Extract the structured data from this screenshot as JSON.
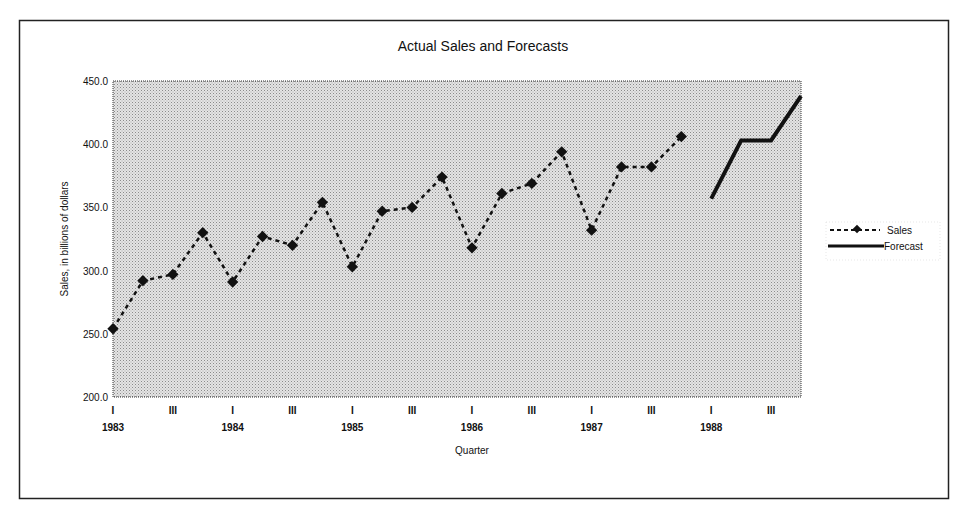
{
  "chart_data": {
    "type": "line",
    "title": "Actual Sales and Forecasts",
    "xlabel": "Quarter",
    "ylabel": "Sales, in billions of dollars",
    "ylim": [
      200,
      450
    ],
    "yticks": [
      "200.0",
      "250.0",
      "300.0",
      "350.0",
      "400.0",
      "450.0"
    ],
    "ytick_values": [
      200,
      250,
      300,
      350,
      400,
      450
    ],
    "x_quarters": [
      "I",
      "II",
      "III",
      "IV",
      "I",
      "II",
      "III",
      "IV",
      "I",
      "II",
      "III",
      "IV",
      "I",
      "II",
      "III",
      "IV",
      "I",
      "II",
      "III",
      "IV",
      "I",
      "II",
      "III",
      "IV"
    ],
    "x_quarter_labels_shown": [
      "I",
      "III"
    ],
    "years": [
      "1983",
      "1984",
      "1985",
      "1986",
      "1987",
      "1988"
    ],
    "grid": false,
    "legend_position": "right",
    "plot_background": "#d9d9d9",
    "series": [
      {
        "name": "Sales",
        "style": "dashed-with-diamond-markers",
        "color": "#111111",
        "start_index": 0,
        "values": [
          254,
          292,
          297,
          330,
          291,
          327,
          320,
          354,
          303,
          347,
          350,
          374,
          318,
          361,
          369,
          394,
          332,
          382,
          382,
          406
        ]
      },
      {
        "name": "Forecast",
        "style": "solid-thick",
        "color": "#111111",
        "start_index": 20,
        "values": [
          357,
          403,
          403,
          438
        ]
      }
    ]
  }
}
